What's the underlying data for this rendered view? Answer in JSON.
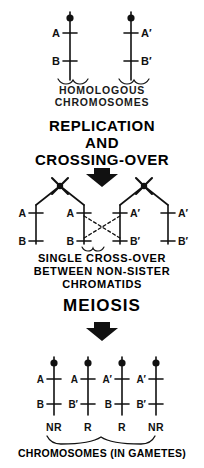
{
  "figure": {
    "ink_color": "#111111",
    "background": "#ffffff"
  },
  "panels": {
    "top": {
      "caption": "HOMOLOGOUS\nCHROMOSOMES",
      "chromosomes": [
        {
          "name": "maternal",
          "locus_upper": "A",
          "locus_lower": "B",
          "label_side": "left"
        },
        {
          "name": "paternal",
          "locus_upper": "A′",
          "locus_lower": "B′",
          "label_side": "right"
        }
      ]
    },
    "step_replication": {
      "title": "REPLICATION\nAND\nCROSSING-OVER",
      "arrow": "down-arrow"
    },
    "middle": {
      "caption": "SINGLE CROSS-OVER\nBETWEEN NON-SISTER\nCHROMATIDS",
      "chromatids": [
        {
          "position": 1,
          "locus_upper": "A",
          "locus_lower": "B",
          "label_side": "left"
        },
        {
          "position": 2,
          "locus_upper": "A",
          "locus_lower": "B",
          "label_side": "left"
        },
        {
          "position": 3,
          "locus_upper": "A′",
          "locus_lower": "B′",
          "label_side": "right"
        },
        {
          "position": 4,
          "locus_upper": "A′",
          "locus_lower": "B′",
          "label_side": "right"
        }
      ],
      "crossover": {
        "style": "dashed",
        "between_chromatids": [
          2,
          3
        ],
        "note": "chiasma between non-sister chromatids"
      }
    },
    "step_meiosis": {
      "title": "MEIOSIS",
      "arrow": "down-arrow"
    },
    "bottom": {
      "caption": "CHROMOSOMES (IN GAMETES)",
      "gametes": [
        {
          "position": 1,
          "locus_upper": "A",
          "locus_lower": "B",
          "type": "NR"
        },
        {
          "position": 2,
          "locus_upper": "A",
          "locus_lower": "B′",
          "type": "R"
        },
        {
          "position": 3,
          "locus_upper": "A′",
          "locus_lower": "B",
          "type": "R"
        },
        {
          "position": 4,
          "locus_upper": "A′",
          "locus_lower": "B′",
          "type": "NR"
        }
      ]
    }
  }
}
